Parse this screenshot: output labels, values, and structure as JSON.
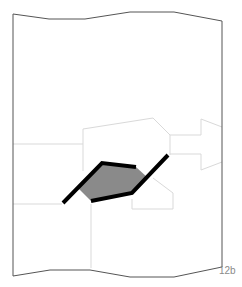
{
  "figure": {
    "label": "12b",
    "colors": {
      "frame": "#555555",
      "region_outline": "#d6d6d6",
      "highlight_fill": "#8a8a8a",
      "highlight_stroke": "#000000"
    }
  }
}
